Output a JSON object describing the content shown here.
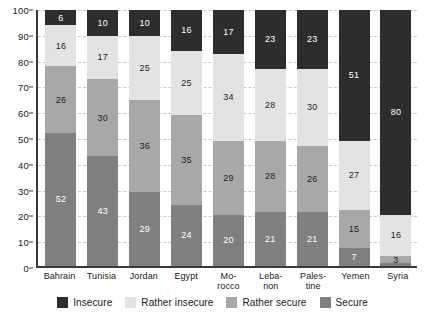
{
  "chart_data": {
    "type": "bar",
    "subtype": "stacked-bar-100-percent",
    "title": "",
    "subtitle": "",
    "xlabel": "",
    "ylabel": "",
    "ylim": [
      0,
      100
    ],
    "yticks": [
      0,
      10,
      20,
      30,
      40,
      50,
      60,
      70,
      80,
      90,
      100
    ],
    "grid": true,
    "legend_position": "bottom",
    "categories": [
      "Bahrain",
      "Tunisia",
      "Jordan",
      "Egypt",
      "Morocco",
      "Lebanon",
      "Palestine",
      "Yemen",
      "Syria"
    ],
    "category_labels": [
      [
        "Bahrain"
      ],
      [
        "Tunisia"
      ],
      [
        "Jordan"
      ],
      [
        "Egypt"
      ],
      [
        "Mo-",
        "rocco"
      ],
      [
        "Leba-",
        "non"
      ],
      [
        "Pales-",
        "tine"
      ],
      [
        "Yemen"
      ],
      [
        "Syria"
      ]
    ],
    "series": [
      {
        "name": "Secure",
        "color": "#808080",
        "values": [
          52,
          43,
          29,
          24,
          20,
          21,
          21,
          7,
          1
        ],
        "labels": [
          "52",
          "43",
          "29",
          "24",
          "20",
          "21",
          "21",
          "7",
          ""
        ]
      },
      {
        "name": "Rather secure",
        "color": "#a8a8a8",
        "values": [
          26,
          30,
          36,
          35,
          29,
          28,
          26,
          15,
          3
        ],
        "labels": [
          "26",
          "30",
          "36",
          "35",
          "29",
          "28",
          "26",
          "15",
          "3"
        ]
      },
      {
        "name": "Rather insecure",
        "color": "#e3e3e3",
        "values": [
          16,
          17,
          25,
          25,
          34,
          28,
          30,
          27,
          16
        ],
        "labels": [
          "16",
          "17",
          "25",
          "25",
          "34",
          "28",
          "30",
          "27",
          "16"
        ]
      },
      {
        "name": "Insecure",
        "color": "#2d2d2d",
        "values": [
          6,
          10,
          10,
          16,
          17,
          23,
          23,
          51,
          80
        ],
        "labels": [
          "6",
          "10",
          "10",
          "16",
          "17",
          "23",
          "23",
          "51",
          "80"
        ]
      }
    ],
    "legend": [
      {
        "label": "Insecure",
        "color": "#2d2d2d"
      },
      {
        "label": "Rather insecure",
        "color": "#e3e3e3"
      },
      {
        "label": "Rather secure",
        "color": "#a8a8a8"
      },
      {
        "label": "Secure",
        "color": "#808080"
      }
    ]
  }
}
